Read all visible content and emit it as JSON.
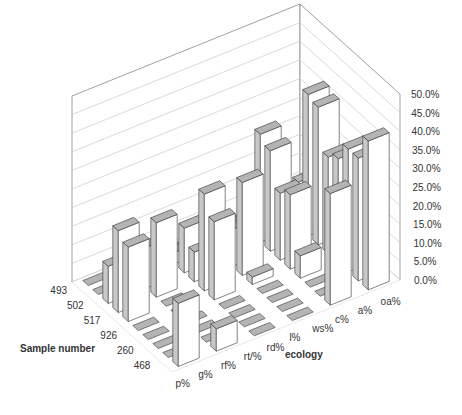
{
  "chart_data": {
    "type": "bar3d",
    "title": "",
    "xlabel": "ecology",
    "ylabel": "Sample number",
    "zlabel": "",
    "categories": [
      "p%",
      "g%",
      "rf%",
      "rt/%",
      "rd%",
      "l%",
      "ws%",
      "c%",
      "a%",
      "oa%"
    ],
    "samples": [
      "493",
      "502",
      "517",
      "926",
      "260",
      "468"
    ],
    "zticks": [
      "0.0%",
      "5.0%",
      "10.0%",
      "15.0%",
      "20.0%",
      "25.0%",
      "30.0%",
      "35.0%",
      "40.0%",
      "45.0%",
      "50.0%"
    ],
    "zlim": [
      0,
      50
    ],
    "grid": true,
    "series": [
      {
        "name": "493",
        "values": [
          4,
          5,
          12,
          38,
          37,
          26,
          28,
          33,
          33,
          40
        ]
      },
      {
        "name": "502",
        "values": [
          1,
          2,
          29,
          27,
          18,
          20,
          6,
          0,
          0,
          30
        ]
      },
      {
        "name": "517",
        "values": [
          0,
          4,
          4,
          10,
          25,
          2,
          0,
          0,
          0,
          0
        ]
      },
      {
        "name": "926",
        "values": [
          0,
          3,
          12,
          8,
          26,
          21,
          0,
          0,
          0,
          0
        ]
      },
      {
        "name": "260",
        "values": [
          3,
          7,
          11,
          20,
          0,
          0,
          0,
          0,
          0,
          6
        ]
      },
      {
        "name": "468",
        "values": [
          0,
          0,
          10,
          22,
          20,
          0,
          0,
          0,
          0,
          17
        ]
      }
    ]
  },
  "colors": {
    "bar_front": "#ffffff",
    "bar_side": "#c8c8c8",
    "bar_top": "#b4b4b4",
    "bar_edge": "#333333",
    "grid": "#c8c8c8",
    "wall": "#888888"
  }
}
